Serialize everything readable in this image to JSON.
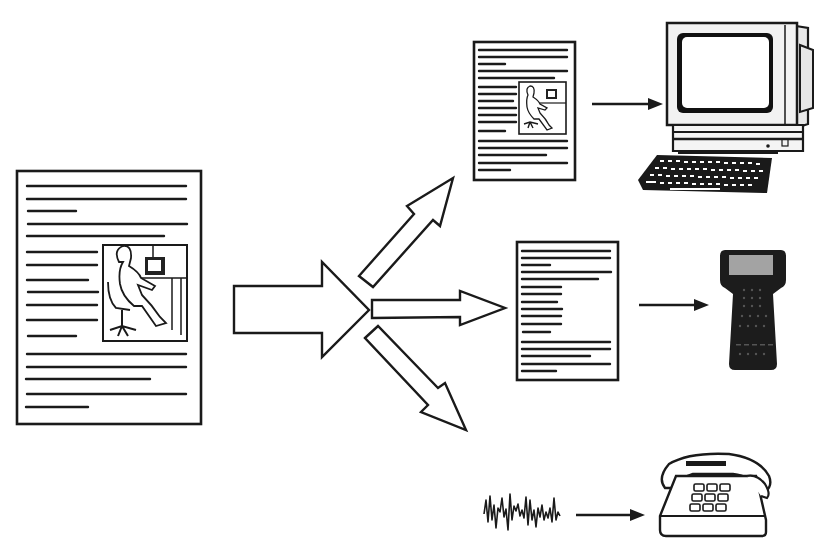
{
  "diagram": {
    "title": "",
    "source": {
      "name": "source-document",
      "has_image": true
    },
    "outputs": [
      {
        "name": "rich-document",
        "has_image": true,
        "target": "desktop-computer"
      },
      {
        "name": "text-only-document",
        "has_image": false,
        "target": "handheld-device"
      },
      {
        "name": "audio-waveform",
        "has_image": false,
        "target": "telephone"
      }
    ],
    "colors": {
      "ink": "#1a1a1a",
      "background": "#ffffff",
      "screen_gray": "#9a9a9a"
    }
  }
}
